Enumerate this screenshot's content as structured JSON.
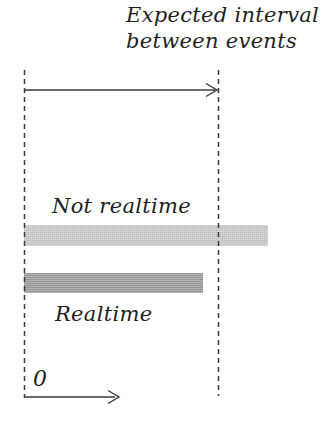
{
  "figure": {
    "title": {
      "line1": "Expected interval",
      "line2": "between events"
    },
    "labels": {
      "not_realtime": "Not realtime",
      "realtime": "Realtime",
      "zero": "0"
    },
    "bars": {
      "not_realtime": {
        "label": "Not realtime",
        "color": "#c9c9c9"
      },
      "realtime": {
        "label": "Realtime",
        "color": "#9a9a9a"
      }
    },
    "colors": {
      "background": "#ffffff",
      "line": "#3a3a3a",
      "text": "#1f1f1f",
      "not_realtime_bar": "#c9c9c9",
      "realtime_bar": "#9a9a9a"
    }
  }
}
